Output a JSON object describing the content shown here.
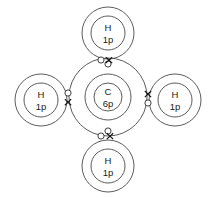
{
  "diagram": {
    "molecule": "CH4",
    "background_color": "#ffffff",
    "line_color": "#4a4a4a",
    "text_color": "#1a1a1a",
    "central_atom": {
      "symbol": "C",
      "nucleus_label": "6p",
      "cx": 108,
      "cy": 97,
      "nucleus_r": 14,
      "inner_shell_r": 23,
      "outer_shell_r": 39
    },
    "hydrogen_atoms": [
      {
        "position": "top",
        "symbol": "H",
        "nucleus_label": "1p",
        "cx": 108,
        "cy": 33,
        "nucleus_r": 17,
        "outer_shell_r": 26
      },
      {
        "position": "left",
        "symbol": "H",
        "nucleus_label": "1p",
        "cx": 41,
        "cy": 100,
        "nucleus_r": 17,
        "outer_shell_r": 26
      },
      {
        "position": "right",
        "symbol": "H",
        "nucleus_label": "1p",
        "cx": 175,
        "cy": 100,
        "nucleus_r": 17,
        "outer_shell_r": 26
      },
      {
        "position": "bottom",
        "symbol": "H",
        "nucleus_label": "1p",
        "cx": 108,
        "cy": 166,
        "nucleus_r": 17,
        "outer_shell_r": 26
      }
    ],
    "bonding_pairs": [
      {
        "bond": "top",
        "dot_x": 101,
        "dot_y": 60,
        "cross_x": 109,
        "cross_y": 60
      },
      {
        "bond": "left",
        "dot_x": 68,
        "dot_y": 93,
        "cross_x": 68,
        "cross_y": 102
      },
      {
        "bond": "right",
        "dot_x": 148,
        "dot_y": 103,
        "cross_x": 148,
        "cross_y": 94
      },
      {
        "bond": "bottom",
        "dot_x": 101,
        "dot_y": 136,
        "cross_x": 110,
        "cross_y": 136
      }
    ],
    "unshared_electrons": [
      {
        "name": "carbon-outer-electron-upper",
        "cx": 108,
        "cy": 64
      },
      {
        "name": "carbon-outer-electron-lower",
        "cx": 108,
        "cy": 131
      }
    ],
    "electron_dot_r": 3.1,
    "electron_cross_arm": 3.2
  }
}
